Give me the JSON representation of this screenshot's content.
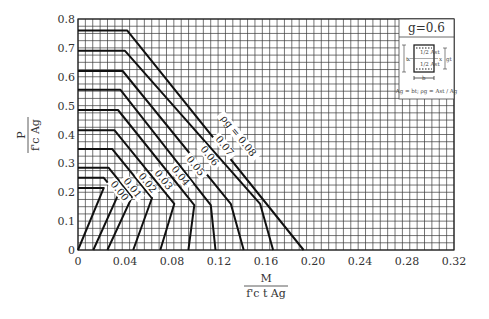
{
  "chart_data": {
    "type": "line",
    "title": "",
    "xlabel": "M / (f'c t Ag)",
    "ylabel": "P / (f'c Ag)",
    "xlim": [
      0,
      0.32
    ],
    "ylim": [
      0,
      0.8
    ],
    "grid": true,
    "x_ticks": [
      "0",
      "0.04",
      "0.08",
      "0.12",
      "0.16",
      "0.20",
      "0.24",
      "0.28",
      "0.32"
    ],
    "y_ticks": [
      "0",
      "0.1",
      "0.2",
      "0.3",
      "0.4",
      "0.5",
      "0.6",
      "0.7",
      "0.8"
    ],
    "series": [
      {
        "name": "ρg = 0.08",
        "label": "ρg = 0.08",
        "points": [
          [
            0,
            0.76
          ],
          [
            0.042,
            0.76
          ],
          [
            0.192,
            0
          ]
        ]
      },
      {
        "name": "ρg = 0.07",
        "label": "0.07",
        "points": [
          [
            0,
            0.69
          ],
          [
            0.04,
            0.69
          ],
          [
            0.155,
            0.16
          ],
          [
            0.166,
            0
          ]
        ]
      },
      {
        "name": "ρg = 0.06",
        "label": "0.06",
        "points": [
          [
            0,
            0.62
          ],
          [
            0.038,
            0.62
          ],
          [
            0.13,
            0.16
          ],
          [
            0.141,
            0
          ]
        ]
      },
      {
        "name": "ρg = 0.05",
        "label": "0.05",
        "points": [
          [
            0,
            0.555
          ],
          [
            0.036,
            0.555
          ],
          [
            0.113,
            0.155
          ],
          [
            0.117,
            0
          ]
        ]
      },
      {
        "name": "ρg = 0.04",
        "label": "0.04",
        "points": [
          [
            0,
            0.485
          ],
          [
            0.034,
            0.485
          ],
          [
            0.099,
            0.155
          ],
          [
            0.094,
            0
          ]
        ]
      },
      {
        "name": "ρg = 0.03",
        "label": "0.03",
        "points": [
          [
            0,
            0.415
          ],
          [
            0.031,
            0.415
          ],
          [
            0.082,
            0.16
          ],
          [
            0.07,
            0
          ]
        ]
      },
      {
        "name": "ρg = 0.02",
        "label": "0.02",
        "points": [
          [
            0,
            0.35
          ],
          [
            0.029,
            0.35
          ],
          [
            0.063,
            0.18
          ],
          [
            0.047,
            0
          ]
        ]
      },
      {
        "name": "ρg = 0.01",
        "label": "0.01",
        "points": [
          [
            0,
            0.285
          ],
          [
            0.026,
            0.285
          ],
          [
            0.046,
            0.185
          ],
          [
            0.025,
            0
          ]
        ]
      },
      {
        "name": "ρg = 0.005",
        "label": "0.00",
        "points": [
          [
            0,
            0.25
          ],
          [
            0.022,
            0.25
          ],
          [
            0.034,
            0.19
          ],
          [
            0.013,
            0
          ]
        ]
      },
      {
        "name": "ρg = 0",
        "label": "0",
        "points": [
          [
            0,
            0.215
          ],
          [
            0.022,
            0.215
          ],
          [
            0.0,
            0
          ]
        ]
      }
    ],
    "annotations": [
      "ρg = 0.08",
      "0.07",
      "0.06",
      "0.05",
      "0.04",
      "0.03",
      "0.02",
      "0.01",
      "0.00"
    ]
  },
  "inset": {
    "title": "g=0.6",
    "section_labels": {
      "top_steel": "1/2 Ast",
      "bottom_steel": "1/2 Ast",
      "width": "b",
      "depth": "t",
      "gap": "gt",
      "axis": "x"
    },
    "note": "Ag = bt; ρg = Ast / Ag"
  },
  "axes": {
    "x_title_num": "M",
    "x_title_den": "f'c t Ag",
    "y_title_num": "P",
    "y_title_den": "f'c Ag"
  }
}
